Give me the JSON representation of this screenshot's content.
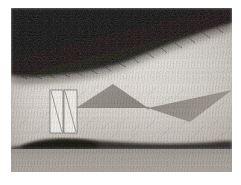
{
  "figure": {
    "domain": "Natural-Image",
    "canvas": {
      "width": 241,
      "height": 185,
      "image_left": 11,
      "image_top": 8,
      "image_width": 221,
      "image_height": 164
    },
    "background_color": "#ffffff"
  },
  "palette": {
    "page_white": "#ffffff",
    "dark_hair_region": "#100e0c",
    "dark_hair_region_inner": "#1b1815",
    "skin_highlight": "#eae5de",
    "skin_midtone": "#d2ccc4",
    "skin_shadow": "#b3aca3",
    "ground_band": "#a9a49d",
    "ground_shadow": "#2a2623",
    "triangle_fill": "#9b958d",
    "triangle_fill_right": "#9a948c",
    "paper_white": "#f6f4f1",
    "paper_line": "#8d8881",
    "paper_edge": "#6f6a64"
  },
  "scene": {
    "regions": [
      {
        "name": "dark-hair-region",
        "description": "Dark textured mass occupying the upper portion, boundary sloping from upper-right down to lower-left",
        "tone": "very dark"
      },
      {
        "name": "skin-region",
        "description": "Bright textured skin surface filling the middle band",
        "tone": "light"
      },
      {
        "name": "ground-band",
        "description": "Flat mid-gray band along the bottom",
        "tone": "medium"
      },
      {
        "name": "ground-shadow",
        "description": "Dark contact shadow line above the ground band",
        "tone": "very dark"
      }
    ],
    "markers": [
      {
        "name": "paper-marker-left",
        "x": 50,
        "y": 90,
        "width": 13,
        "height": 43,
        "diagonal": "top-left to bottom-right"
      },
      {
        "name": "paper-marker-right",
        "x": 64,
        "y": 90,
        "width": 13,
        "height": 43,
        "diagonal": "top-left to bottom-right"
      }
    ],
    "overlays": [
      {
        "name": "triangle-left",
        "points": "76,108 113,84 148,108",
        "fill": "#9b958d",
        "description": "Wide upward-pointing triangle on the left"
      },
      {
        "name": "triangle-right",
        "points": "148,108 232,90 190,122",
        "fill": "#9a948c",
        "description": "Triangle pointing down-right, sharing the vertex with the left triangle"
      }
    ],
    "shared_vertex": {
      "x": 148,
      "y": 108,
      "label": "bowtie junction"
    }
  },
  "geometry": {
    "dark_region_path": "M 0 0 L 221 0 L 221 14 C 190 22 150 38 116 52 C 86 63 50 66 22 68 C 14 68 6 67 0 66 Z",
    "dark_region_soft_path": "M 0 0 L 221 0 L 221 20 C 188 29 148 44 114 58 C 84 69 48 72 20 74 C 13 74 6 73 0 72 Z",
    "ground_band_rect": {
      "x": 0,
      "y": 140,
      "width": 221,
      "height": 24
    },
    "ground_shadow_path": "M 8 137 C 30 131 62 130 92 133 C 130 136 176 137 213 133 L 221 133 L 221 141 L 0 141 L 0 138 Z"
  }
}
